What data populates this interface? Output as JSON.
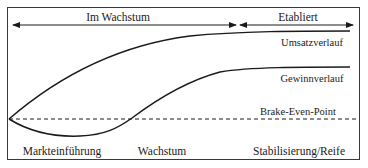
{
  "diagram": {
    "phases_top": [
      {
        "label": "Im Wachstum",
        "x1": 13,
        "x2": 236,
        "label_x": 118
      },
      {
        "label": "Etabliert",
        "x1": 240,
        "x2": 353,
        "label_x": 298
      }
    ],
    "curves": [
      {
        "name": "Umsatzverlauf",
        "label": "Umsatzverlauf",
        "label_x": 312,
        "label_y": 46
      },
      {
        "name": "Gewinnverlauf",
        "label": "Gewinnverlauf",
        "label_x": 312,
        "label_y": 82
      }
    ],
    "break_even": {
      "label": "Brake-Even-Point",
      "label_x": 298,
      "label_y": 115,
      "y": 119
    },
    "phases_bottom": [
      {
        "label": "Markteinführung",
        "x": 62
      },
      {
        "label": "Wachstum",
        "x": 162
      },
      {
        "label": "Stabilisierung/Reife",
        "x": 299
      }
    ],
    "colors": {
      "line": "#1a1a1a",
      "frame": "#3a3a3a",
      "background": "#ffffff"
    }
  }
}
